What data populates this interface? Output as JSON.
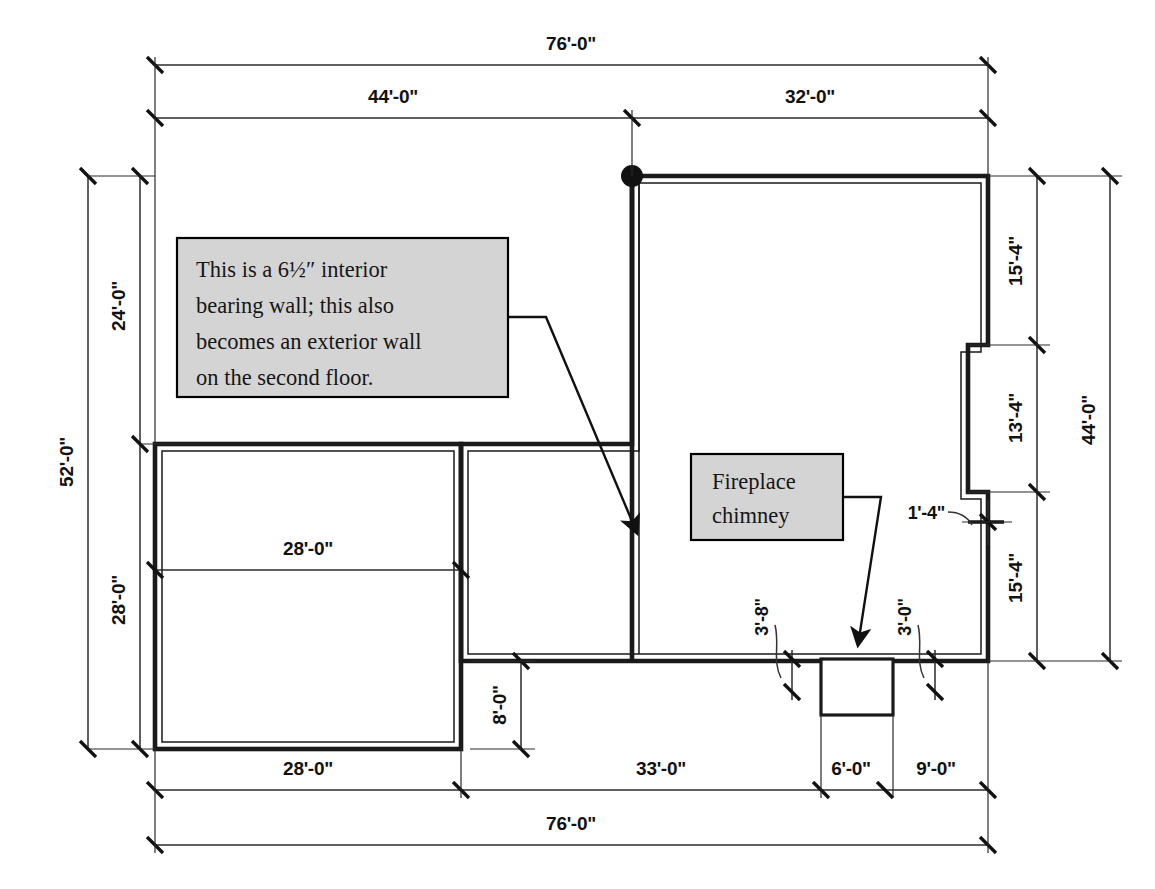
{
  "drawing": {
    "type": "architectural-floor-plan",
    "title": "Foundation / first floor plan with dimension chains"
  },
  "callouts": [
    {
      "id": "bearing-wall-note",
      "lines": [
        "This is a 6½″ interior",
        "bearing wall; this also",
        "becomes an exterior wall",
        "on the second floor."
      ],
      "fill": "#d4d4d4",
      "border": "#000000"
    },
    {
      "id": "fireplace-note",
      "lines": [
        "Fireplace",
        "chimney"
      ],
      "fill": "#d4d4d4",
      "border": "#000000"
    }
  ],
  "dimensions": {
    "top_overall": "76'-0\"",
    "top_chain": [
      "44'-0\"",
      "32'-0\""
    ],
    "left_overall": "52'-0\"",
    "left_chain": [
      "24'-0\"",
      "28'-0\""
    ],
    "right_overall": "44'-0\"",
    "right_chain": [
      "15'-4\"",
      "13'-4\"",
      "15'-4\""
    ],
    "bottom_overall": "76'-0\"",
    "bottom_chain": [
      "28'-0\"",
      "33'-0\"",
      "6'-0\"",
      "9'-0\""
    ],
    "interior_room_width": "28'-0\"",
    "interior_offset": "8'-0\"",
    "wall_jog": "1'-4\"",
    "chimney_left": "3'-8\"",
    "chimney_right": "3'-0\""
  },
  "features": {
    "corner_node_label": "reference-point",
    "chimney_label": "fireplace-chimney",
    "wall_thickness_note": "6½″"
  }
}
